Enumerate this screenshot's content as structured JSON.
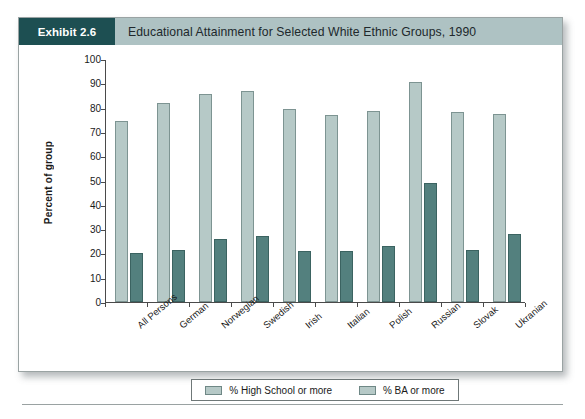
{
  "exhibit": {
    "badge_label": "Exhibit 2.6",
    "title": "Educational Attainment for Selected White Ethnic Groups, 1990"
  },
  "colors": {
    "header_band": "#aec2c3",
    "badge": "#1d4f52",
    "bar_high_school": "#b6c9c7",
    "bar_ba": "#53807e",
    "axis": "#4a4a4a"
  },
  "chart_data": {
    "type": "bar",
    "title": "Educational Attainment for Selected White Ethnic Groups, 1990",
    "xlabel": "",
    "ylabel": "Percent of group",
    "ylim": [
      0,
      100
    ],
    "ytick_labels": [
      "100",
      "90",
      "80",
      "70",
      "60",
      "50",
      "40",
      "30",
      "20",
      "10",
      "0"
    ],
    "yticks": [
      100,
      90,
      80,
      70,
      60,
      50,
      40,
      30,
      20,
      10,
      0
    ],
    "grid": false,
    "legend_position": "bottom",
    "categories": [
      "All Persons",
      "German",
      "Norwegian",
      "Swedish",
      "Irish",
      "Italian",
      "Polish",
      "Russian",
      "Slovak",
      "Ukranian"
    ],
    "series": [
      {
        "name": "% High School or more",
        "values": [
          74.5,
          82.0,
          85.5,
          87.0,
          79.5,
          77.0,
          78.5,
          90.5,
          78.0,
          77.5
        ]
      },
      {
        "name": "% BA or more",
        "values": [
          20.0,
          21.5,
          25.8,
          27.0,
          21.0,
          21.0,
          23.0,
          49.0,
          21.5,
          28.0
        ]
      }
    ]
  }
}
